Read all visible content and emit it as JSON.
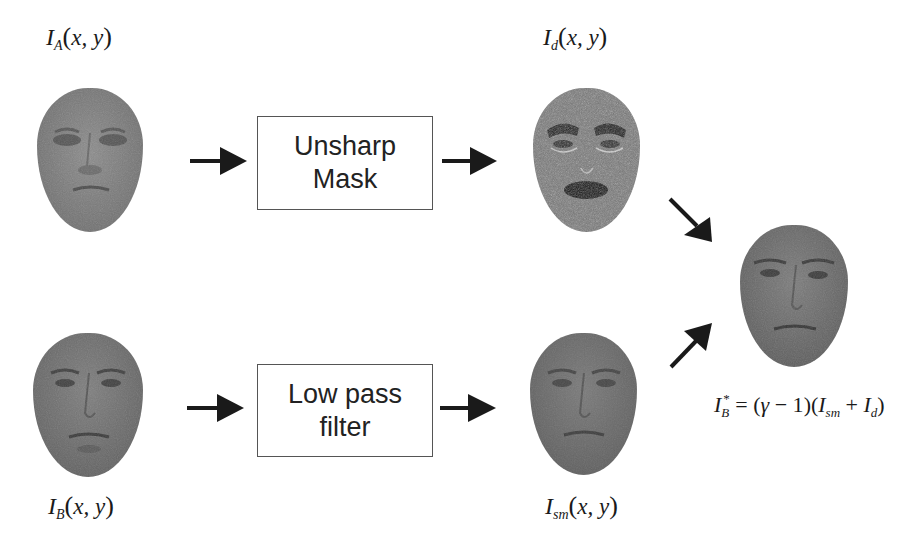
{
  "diagram": {
    "type": "image-processing-pipeline",
    "nodes": {
      "input_a": {
        "symbol": "I",
        "subscript": "A",
        "args": "x, y",
        "image": "face-image-A"
      },
      "input_b": {
        "symbol": "I",
        "subscript": "B",
        "args": "x, y",
        "image": "face-image-B"
      },
      "detail": {
        "symbol": "I",
        "subscript": "d",
        "args": "x, y",
        "image": "unsharp-masked-face"
      },
      "smooth": {
        "symbol": "I",
        "subscript": "sm",
        "args": "x, y",
        "image": "low-pass-filtered-face"
      },
      "output": {
        "image": "combined-output-face"
      }
    },
    "boxes": {
      "unsharp": {
        "line1": "Unsharp",
        "line2": "Mask"
      },
      "lowpass": {
        "line1": "Low pass",
        "line2": "filter"
      }
    },
    "formula": {
      "lhs_symbol": "I",
      "lhs_sub": "B",
      "lhs_sup": "*",
      "eq": " = ",
      "open1": "(",
      "gamma": "γ",
      "minus_one": " − 1",
      "close1": ")",
      "open2": "(",
      "t1_symbol": "I",
      "t1_sub": "sm",
      "plus": " + ",
      "t2_symbol": "I",
      "t2_sub": "d",
      "close2": ")"
    },
    "edges": [
      {
        "from": "input_a",
        "to": "unsharp"
      },
      {
        "from": "unsharp",
        "to": "detail"
      },
      {
        "from": "input_b",
        "to": "lowpass"
      },
      {
        "from": "lowpass",
        "to": "smooth"
      },
      {
        "from": "detail",
        "to": "output"
      },
      {
        "from": "smooth",
        "to": "output"
      }
    ],
    "colors": {
      "arrow": "#1a1a1a",
      "box_border": "#555555",
      "face_gray": "#7a7a7a"
    }
  }
}
